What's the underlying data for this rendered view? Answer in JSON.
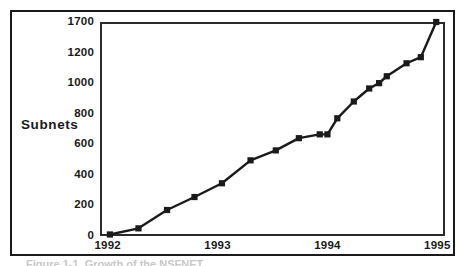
{
  "figure": {
    "caption": "Figure 1-1. Growth of the NSFNET",
    "y_axis_title": "Subnets"
  },
  "chart_data": {
    "type": "line",
    "title": "",
    "subtitle": "",
    "xlabel": "",
    "ylabel": "Subnets",
    "grid": false,
    "legend": false,
    "legend_position": "none",
    "marker": "square",
    "line_color": "#1a1a1a",
    "marker_color": "#1a1a1a",
    "x_tick_labels": [
      "1992",
      "1993",
      "1994",
      "1995"
    ],
    "x_tick_values": [
      1992,
      1993,
      1994,
      1995
    ],
    "xlim": [
      1991.93,
      1995.07
    ],
    "y_tick_labels": [
      "0",
      "200",
      "400",
      "600",
      "800",
      "1000",
      "1200",
      "1700"
    ],
    "y_tick_values": [
      0,
      200,
      400,
      600,
      800,
      1000,
      1200,
      1700
    ],
    "ylim": [
      0,
      1700
    ],
    "y_axis_note": "top tick is 1700; spacing between 1200 and 1700 matches the other 200-unit steps",
    "x": [
      1992.02,
      1992.28,
      1992.54,
      1992.79,
      1993.04,
      1993.3,
      1993.53,
      1993.74,
      1993.93,
      1994.0,
      1994.09,
      1994.24,
      1994.38,
      1994.47,
      1994.54,
      1994.72,
      1994.85,
      1994.99
    ],
    "values": [
      10,
      50,
      170,
      255,
      345,
      495,
      560,
      640,
      665,
      665,
      770,
      880,
      965,
      1000,
      1045,
      1130,
      1170,
      1700
    ],
    "point_count": 18,
    "series": [
      {
        "name": "Subnets",
        "values": [
          10,
          50,
          170,
          255,
          345,
          495,
          560,
          640,
          665,
          665,
          770,
          880,
          965,
          1000,
          1045,
          1130,
          1170,
          1700
        ]
      }
    ]
  }
}
